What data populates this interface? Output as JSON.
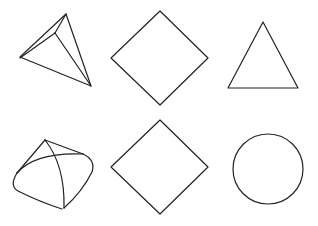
{
  "figure": {
    "width": 318,
    "height": 226,
    "background": "#ffffff",
    "stroke_color": "#222222",
    "layout": "2 rows x 3 columns of line-drawn shapes",
    "shapes": [
      {
        "row": 1,
        "col": 1,
        "kind": "triangular-pyramid",
        "description": "3D tetrahedron-like pyramid, line drawing"
      },
      {
        "row": 1,
        "col": 2,
        "kind": "diamond",
        "description": "square rotated 45 degrees"
      },
      {
        "row": 1,
        "col": 3,
        "kind": "triangle",
        "description": "upright triangle"
      },
      {
        "row": 2,
        "col": 1,
        "kind": "rounded-pyramid",
        "description": "pyramid with curved, rounded edges"
      },
      {
        "row": 2,
        "col": 2,
        "kind": "diamond",
        "description": "square rotated 45 degrees"
      },
      {
        "row": 2,
        "col": 3,
        "kind": "circle",
        "description": "circle outline"
      }
    ]
  }
}
